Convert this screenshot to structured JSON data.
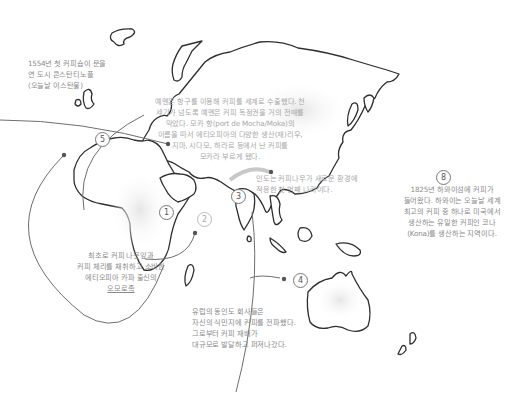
{
  "map": {
    "title": "Coffee spread world map",
    "colors": {
      "coast": "#2e2e2e",
      "route": "#6e6e6e",
      "route_light": "#c8c8c8",
      "text": "#8a8a8a",
      "text_light": "#a8a8a8",
      "background": "#ffffff"
    }
  },
  "annotations": [
    {
      "id": "constantinople",
      "lines": [
        "1554년 첫 커피숍이 문을",
        "연 도시 콘스탄티노플",
        "(오늘날 이스탄불)"
      ]
    },
    {
      "id": "yemen",
      "lines": [
        "예멘은 항구를 이용해 커피를 세계로 수출했다. 천",
        "세기가 넘도록 예멘은 커피 독점권을 거의 전매를",
        "막았다. 모카 항(port de Mocha/Moka)의",
        "이름을 따서 에티오피아의 다양한 생산(재)리우,",
        "지마, 시다모, 하라르 등에서 난 커피를",
        "모카라 부르게 됐다."
      ]
    },
    {
      "id": "india",
      "lines": [
        "인도는 커피나무가 새로운 환경에",
        "적응한 첫 번째 나라이다."
      ]
    },
    {
      "id": "hawaii",
      "marker": "8",
      "lines": [
        "1825년 하와이섬에 커피가",
        "들어왔다. 하와이는 오늘날 세계",
        "최고의 커피 중 하나로 미국에서",
        "생산하는 유일한 커피인 코나",
        "(Kona)를 생산하는 지역이다."
      ]
    },
    {
      "id": "ethiopia",
      "lines": [
        "최초로 커피 나뭇잎과",
        "커피 체리를 채취하고 소비한",
        "에티오피아 카파 출신의",
        "오모로족"
      ]
    },
    {
      "id": "dutch",
      "lines": [
        "유럽의 동인도 회사들은",
        "자신의 식민지에 커피를 전파했다.",
        "그로부터 커피 재배가",
        "대규모로 발달하고 퍼져나갔다."
      ]
    }
  ],
  "markers": [
    {
      "label": "1",
      "region": "ethiopia"
    },
    {
      "label": "2",
      "region": "yemen"
    },
    {
      "label": "3",
      "region": "india"
    },
    {
      "label": "4",
      "region": "indonesia"
    },
    {
      "label": "5",
      "region": "europe"
    },
    {
      "label": "8",
      "region": "hawaii"
    }
  ]
}
